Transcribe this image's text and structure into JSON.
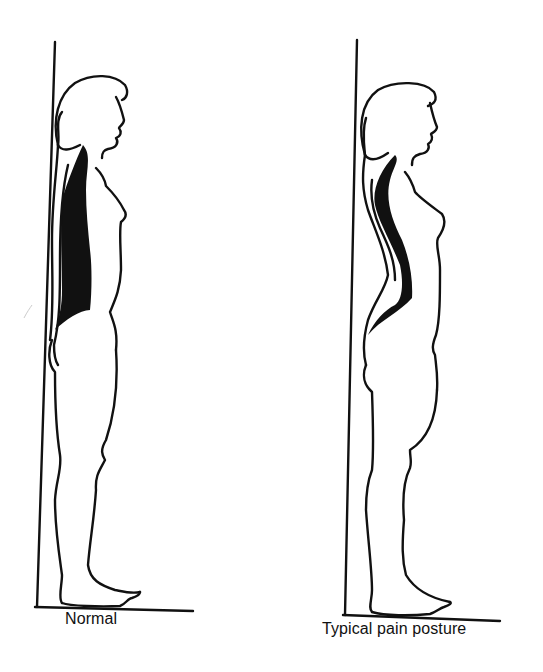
{
  "figure": {
    "type": "posture comparison illustration",
    "colors": {
      "ink": "#111111",
      "background": "#ffffff"
    },
    "panels": [
      {
        "id": "normal",
        "caption": "Normal",
        "description": "Standing female silhouette against a wall, spine curve shaded black, upright posture"
      },
      {
        "id": "pain",
        "caption": "Typical pain posture",
        "description": "Standing female silhouette against a wall, increased lumbar curve shaded black, forward pelvis"
      }
    ]
  }
}
